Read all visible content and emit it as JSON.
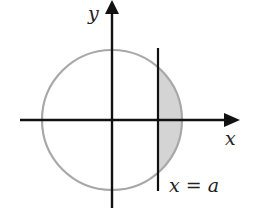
{
  "diagram": {
    "axes": {
      "x_label": "x",
      "y_label": "y"
    },
    "line_label": "x = a",
    "colors": {
      "axis": "#111111",
      "circle": "#a8a8a8",
      "shade": "#d4d4d4",
      "text": "#222222"
    }
  }
}
